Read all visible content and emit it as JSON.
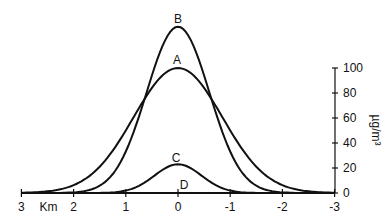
{
  "chart_data": {
    "type": "line",
    "title": "",
    "xlabel": "Km",
    "ylabel": "µg/m³",
    "x_ticks": [
      3,
      2,
      1,
      0,
      -1,
      -2,
      -3
    ],
    "x_tick_labels": [
      "3",
      "2",
      "1",
      "0",
      "-1",
      "-2",
      "-3"
    ],
    "y_ticks": [
      0,
      20,
      40,
      60,
      80,
      100
    ],
    "y_tick_labels": [
      "0",
      "20",
      "40",
      "60",
      "80",
      "100"
    ],
    "xlim": [
      3,
      -3
    ],
    "ylim": [
      0,
      100
    ],
    "y_axis_position": "right",
    "grid": false,
    "legend": "none (curves labeled directly)",
    "series": [
      {
        "name": "B",
        "shape": "gaussian",
        "peak_x": 0,
        "peak_y": 133,
        "sigma_km": 0.6
      },
      {
        "name": "A",
        "shape": "gaussian",
        "peak_x": 0,
        "peak_y": 100,
        "sigma_km": 0.85
      },
      {
        "name": "C",
        "shape": "gaussian",
        "peak_x": 0,
        "peak_y": 23,
        "sigma_km": 0.45
      },
      {
        "name": "D",
        "shape": "flat",
        "peak_x": 0,
        "peak_y": 0
      }
    ],
    "annotations": [
      "B",
      "A",
      "C",
      "D"
    ]
  },
  "labels": {
    "km": "Km",
    "unit": "µg/m³",
    "B": "B",
    "A": "A",
    "C": "C",
    "D": "D"
  }
}
